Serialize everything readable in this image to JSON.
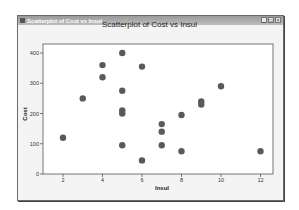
{
  "window": {
    "title": "Scatterplot of Cost vs Insul",
    "buttons": [
      "minimize",
      "maximize",
      "close"
    ]
  },
  "chart_data": {
    "type": "scatter",
    "title": "Scatterplot of Cost vs Insul",
    "xlabel": "Insul",
    "ylabel": "Cost",
    "xlim": [
      1.5,
      12.6
    ],
    "ylim": [
      0,
      420
    ],
    "xticks": [
      2,
      4,
      6,
      8,
      10,
      12
    ],
    "yticks": [
      0,
      100,
      200,
      300,
      400
    ],
    "grid": false,
    "marker_color": "#5a5a5a",
    "points": [
      {
        "x": 2,
        "y": 120
      },
      {
        "x": 3,
        "y": 250
      },
      {
        "x": 4,
        "y": 360
      },
      {
        "x": 4,
        "y": 320
      },
      {
        "x": 5,
        "y": 400
      },
      {
        "x": 5,
        "y": 275
      },
      {
        "x": 5,
        "y": 210
      },
      {
        "x": 5,
        "y": 200
      },
      {
        "x": 5,
        "y": 95
      },
      {
        "x": 6,
        "y": 355
      },
      {
        "x": 6,
        "y": 45
      },
      {
        "x": 7,
        "y": 165
      },
      {
        "x": 7,
        "y": 140
      },
      {
        "x": 7,
        "y": 95
      },
      {
        "x": 8,
        "y": 195
      },
      {
        "x": 8,
        "y": 75
      },
      {
        "x": 9,
        "y": 240
      },
      {
        "x": 9,
        "y": 230
      },
      {
        "x": 10,
        "y": 290
      },
      {
        "x": 12,
        "y": 75
      }
    ]
  }
}
